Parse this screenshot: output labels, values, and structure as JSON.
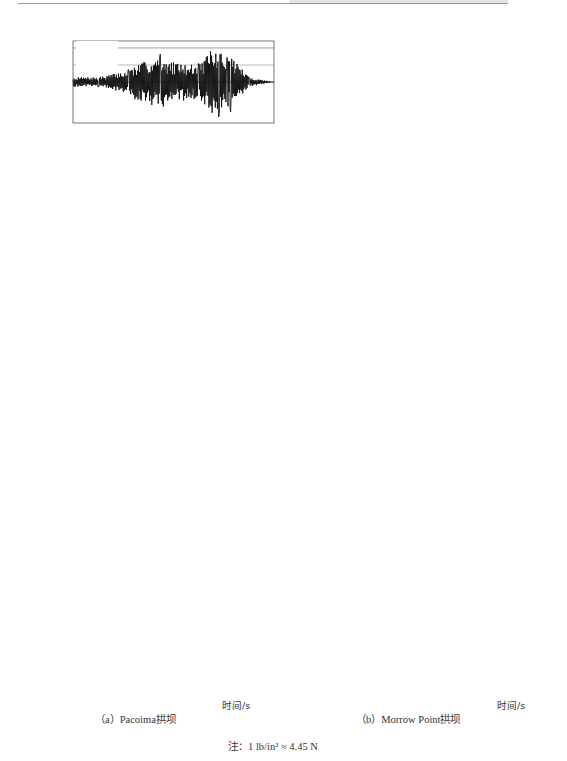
{
  "captions": {
    "left": "（a）Pacoima拱坝",
    "right": "（b）Morrow Point拱坝",
    "xlabel": "时间/s",
    "note": "注：1 lb/in² ≈ 4.45 N"
  },
  "colors": {
    "trace": "#111111",
    "frame": "#555555",
    "dcr_line": "#8c8c8c",
    "zero_line": "#555555"
  },
  "chart_data": [
    {
      "panel": "a",
      "title": "Pacoima拱坝",
      "type": "line",
      "xlabel": "时间/s",
      "ylabel": "拱应力/(lb/in²)",
      "xlim": [
        0,
        12
      ],
      "xticks": [
        0,
        4,
        8,
        12
      ],
      "ylim": [
        -1000,
        1000
      ],
      "yticks": [
        1000,
        500,
        0,
        -500,
        -1000
      ],
      "dcr": {
        "DCR=2": 830,
        "DCR=1": 415
      },
      "series": [
        {
          "name": "Pacx",
          "peaks": [
            [
              0.5,
              120
            ],
            [
              1.5,
              -120
            ],
            [
              3.3,
              300
            ],
            [
              3.7,
              -420
            ],
            [
              5.2,
              680
            ],
            [
              5.4,
              -600
            ],
            [
              6.0,
              480
            ],
            [
              6.6,
              -450
            ],
            [
              7.5,
              450
            ],
            [
              8.2,
              750
            ],
            [
              8.3,
              -750
            ],
            [
              8.7,
              -850
            ],
            [
              9.2,
              600
            ],
            [
              9.4,
              -730
            ],
            [
              10.5,
              120
            ],
            [
              12,
              0
            ]
          ]
        },
        {
          "name": "Pacb",
          "peaks": [
            [
              0.5,
              150
            ],
            [
              1.5,
              -150
            ],
            [
              3.0,
              250
            ],
            [
              3.5,
              -300
            ],
            [
              5.0,
              550
            ],
            [
              5.2,
              -530
            ],
            [
              6.0,
              500
            ],
            [
              6.5,
              -450
            ],
            [
              7.0,
              420
            ],
            [
              8.2,
              840
            ],
            [
              8.3,
              -850
            ],
            [
              8.7,
              -880
            ],
            [
              9.5,
              680
            ],
            [
              9.6,
              -770
            ],
            [
              11.0,
              150
            ],
            [
              12,
              0
            ]
          ]
        },
        {
          "name": "Pacn",
          "peaks": [
            [
              0.5,
              60
            ],
            [
              1.5,
              -60
            ],
            [
              3.3,
              50
            ],
            [
              3.6,
              500
            ],
            [
              3.7,
              -480
            ],
            [
              4.2,
              520
            ],
            [
              4.4,
              -530
            ],
            [
              4.8,
              380
            ],
            [
              5.5,
              150
            ],
            [
              6.7,
              130
            ],
            [
              7.5,
              250
            ],
            [
              7.7,
              -300
            ],
            [
              8.0,
              280
            ],
            [
              9.0,
              80
            ],
            [
              12,
              0
            ]
          ]
        },
        {
          "name": "U56",
          "peaks": [
            [
              0.5,
              30
            ],
            [
              1.5,
              100
            ],
            [
              2.0,
              280
            ],
            [
              2.5,
              450
            ],
            [
              2.6,
              -350
            ],
            [
              3.3,
              380
            ],
            [
              3.8,
              300
            ],
            [
              4.5,
              -300
            ],
            [
              4.8,
              -380
            ],
            [
              5.1,
              630
            ],
            [
              5.5,
              350
            ],
            [
              6.2,
              -200
            ],
            [
              7.0,
              80
            ],
            [
              10.0,
              80
            ],
            [
              12,
              0
            ]
          ]
        },
        {
          "name": "Cld",
          "peaks": [
            [
              0.5,
              70
            ],
            [
              1.5,
              220
            ],
            [
              1.7,
              -300
            ],
            [
              2.1,
              300
            ],
            [
              2.5,
              -200
            ],
            [
              3.5,
              120
            ],
            [
              3.8,
              -400
            ],
            [
              3.9,
              760
            ],
            [
              4.0,
              -820
            ],
            [
              4.3,
              630
            ],
            [
              4.6,
              -780
            ],
            [
              4.9,
              520
            ],
            [
              5.5,
              300
            ],
            [
              6.5,
              180
            ],
            [
              7.5,
              120
            ],
            [
              8.5,
              60
            ],
            [
              12,
              0
            ]
          ]
        },
        {
          "name": "Gly",
          "peaks": [
            [
              0.5,
              40
            ],
            [
              2.0,
              80
            ],
            [
              3.3,
              100
            ],
            [
              3.6,
              450
            ],
            [
              3.8,
              -560
            ],
            [
              4.2,
              400
            ],
            [
              4.3,
              710
            ],
            [
              4.4,
              -610
            ],
            [
              4.8,
              280
            ],
            [
              5.3,
              260
            ],
            [
              6.0,
              80
            ],
            [
              8.0,
              150
            ],
            [
              9.0,
              90
            ],
            [
              12,
              0
            ]
          ]
        }
      ]
    },
    {
      "panel": "b",
      "title": "Morrow Point拱坝",
      "type": "line",
      "xlabel": "时间/s",
      "ylabel": "拱应力/(lb/in²)",
      "xlim": [
        0,
        12
      ],
      "xticks": [
        0,
        4,
        8,
        12
      ],
      "ylim": [
        -3000,
        3000
      ],
      "yticks": [
        3000,
        2000,
        1000,
        0,
        -1000,
        -2000,
        -3000
      ],
      "dcr": {
        "DCR=2": 800,
        "DCR=1": 400
      },
      "series": [
        {
          "name": "Pacx",
          "peaks": [
            [
              0.5,
              -300
            ],
            [
              2.0,
              -200
            ],
            [
              3.5,
              800
            ],
            [
              3.8,
              1600
            ],
            [
              3.9,
              -2000
            ],
            [
              5.4,
              800
            ],
            [
              6.2,
              -2500
            ],
            [
              6.4,
              2100
            ],
            [
              6.7,
              -2000
            ],
            [
              7.5,
              1200
            ],
            [
              8.1,
              -2300
            ],
            [
              8.4,
              2000
            ],
            [
              8.9,
              1800
            ],
            [
              9.5,
              -2200
            ],
            [
              11.0,
              700
            ],
            [
              12,
              0
            ]
          ]
        },
        {
          "name": "Pacb",
          "peaks": [
            [
              0.5,
              -300
            ],
            [
              2.0,
              -200
            ],
            [
              3.6,
              800
            ],
            [
              5.3,
              1000
            ],
            [
              6.1,
              2100
            ],
            [
              6.5,
              1600
            ],
            [
              7.0,
              -2000
            ],
            [
              7.5,
              900
            ],
            [
              9.0,
              1500
            ],
            [
              9.5,
              -1900
            ],
            [
              9.8,
              600
            ],
            [
              11.0,
              400
            ],
            [
              12,
              -100
            ]
          ]
        },
        {
          "name": "Pacn",
          "peaks": [
            [
              0.5,
              -300
            ],
            [
              2.5,
              -300
            ],
            [
              3.4,
              100
            ],
            [
              3.8,
              -1700
            ],
            [
              3.9,
              2300
            ],
            [
              4.0,
              -3000
            ],
            [
              4.2,
              2400
            ],
            [
              4.4,
              -2300
            ],
            [
              4.8,
              900
            ],
            [
              5.2,
              -1100
            ],
            [
              6.0,
              300
            ],
            [
              7.2,
              300
            ],
            [
              8.0,
              200
            ],
            [
              10.0,
              -200
            ],
            [
              12,
              -400
            ]
          ]
        },
        {
          "name": "U56",
          "peaks": [
            [
              0.5,
              -200
            ],
            [
              1.8,
              200
            ],
            [
              2.2,
              -1300
            ],
            [
              2.8,
              800
            ],
            [
              3.6,
              1100
            ],
            [
              4.3,
              -1500
            ],
            [
              4.6,
              -1900
            ],
            [
              5.0,
              2000
            ],
            [
              5.2,
              -500
            ],
            [
              5.9,
              -1100
            ],
            [
              7.0,
              0
            ],
            [
              10.0,
              100
            ],
            [
              12,
              0
            ]
          ]
        },
        {
          "name": "Cld",
          "peaks": [
            [
              0.5,
              -300
            ],
            [
              2.3,
              300
            ],
            [
              3.6,
              500
            ],
            [
              3.9,
              -2200
            ],
            [
              4.0,
              1900
            ],
            [
              4.2,
              -1400
            ],
            [
              4.6,
              -3000
            ],
            [
              4.8,
              2400
            ],
            [
              5.0,
              -2500
            ],
            [
              5.2,
              700
            ],
            [
              6.0,
              500
            ],
            [
              7.0,
              300
            ],
            [
              8.0,
              0
            ],
            [
              12,
              -400
            ]
          ]
        },
        {
          "name": "Gly",
          "peaks": [
            [
              0.5,
              -100
            ],
            [
              2.0,
              -100
            ],
            [
              3.5,
              300
            ],
            [
              4.0,
              1700
            ],
            [
              4.2,
              -1700
            ],
            [
              4.5,
              3000
            ],
            [
              4.6,
              -3000
            ],
            [
              4.8,
              3000
            ],
            [
              5.1,
              -2000
            ],
            [
              5.3,
              1900
            ],
            [
              6.0,
              1400
            ],
            [
              6.5,
              -900
            ],
            [
              7.5,
              700
            ],
            [
              8.9,
              300
            ],
            [
              10.0,
              -100
            ],
            [
              12,
              -100
            ]
          ]
        }
      ]
    }
  ]
}
